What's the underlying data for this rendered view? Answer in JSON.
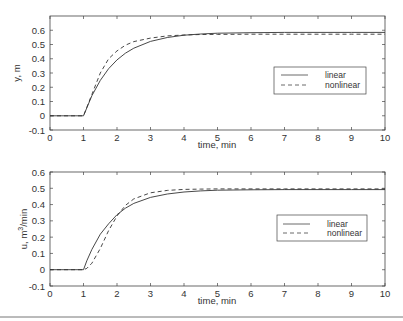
{
  "chart_data": [
    {
      "type": "line",
      "title": "",
      "xlabel": "time, min",
      "ylabel": "y, m",
      "xlim": [
        0,
        10
      ],
      "ylim": [
        -0.1,
        0.7
      ],
      "xticks": [
        0,
        1,
        2,
        3,
        4,
        5,
        6,
        7,
        8,
        9,
        10
      ],
      "yticks": [
        -0.1,
        0,
        0.1,
        0.2,
        0.3,
        0.4,
        0.5,
        0.6
      ],
      "ytick_labels": [
        "-0.1",
        "0",
        "0.1",
        "0.2",
        "0.3",
        "0.4",
        "0.5",
        "0.6"
      ],
      "grid": false,
      "legend_position": "center-right",
      "x": [
        0,
        1,
        1.25,
        1.5,
        1.75,
        2,
        2.25,
        2.5,
        3,
        3.5,
        4,
        4.5,
        5,
        6,
        7,
        8,
        9,
        10
      ],
      "series": [
        {
          "name": "linear",
          "style": "solid",
          "values": [
            0,
            0,
            0.141,
            0.248,
            0.33,
            0.392,
            0.439,
            0.474,
            0.522,
            0.549,
            0.565,
            0.574,
            0.579,
            0.583,
            0.585,
            0.585,
            0.585,
            0.585
          ]
        },
        {
          "name": "nonlinear",
          "style": "dashed",
          "values": [
            0,
            0,
            0.15,
            0.3,
            0.4,
            0.455,
            0.495,
            0.52,
            0.545,
            0.56,
            0.567,
            0.57,
            0.571,
            0.572,
            0.572,
            0.572,
            0.572,
            0.572
          ]
        }
      ]
    },
    {
      "type": "line",
      "title": "",
      "xlabel": "time, min",
      "ylabel": "u, m³/min",
      "xlim": [
        0,
        10
      ],
      "ylim": [
        -0.1,
        0.6
      ],
      "xticks": [
        0,
        1,
        2,
        3,
        4,
        5,
        6,
        7,
        8,
        9,
        10
      ],
      "yticks": [
        -0.1,
        0,
        0.1,
        0.2,
        0.3,
        0.4,
        0.5,
        0.6
      ],
      "ytick_labels": [
        "-0.1",
        "0",
        "0.1",
        "0.2",
        "0.3",
        "0.4",
        "0.5",
        "0.6"
      ],
      "grid": false,
      "legend_position": "center-right",
      "x": [
        0,
        1,
        1.1,
        1.25,
        1.5,
        1.75,
        2,
        2.25,
        2.5,
        3,
        3.5,
        4,
        4.5,
        5,
        6,
        7,
        8,
        9,
        10
      ],
      "series": [
        {
          "name": "linear",
          "style": "solid",
          "values": [
            0,
            0,
            0.055,
            0.125,
            0.218,
            0.282,
            0.338,
            0.378,
            0.407,
            0.444,
            0.465,
            0.477,
            0.484,
            0.488,
            0.491,
            0.492,
            0.492,
            0.492,
            0.492
          ]
        },
        {
          "name": "nonlinear",
          "style": "dashed",
          "values": [
            0,
            0,
            0.008,
            0.04,
            0.13,
            0.24,
            0.33,
            0.395,
            0.435,
            0.472,
            0.487,
            0.493,
            0.495,
            0.496,
            0.496,
            0.496,
            0.496,
            0.496,
            0.496
          ]
        }
      ]
    }
  ],
  "legend": {
    "linear": "linear",
    "nonlinear": "nonlinear"
  },
  "top_plot": {
    "xlabel": "time, min",
    "ylabel": "y, m"
  },
  "bottom_plot": {
    "xlabel": "time, min",
    "ylabel_main": "u, m",
    "ylabel_sup": "3",
    "ylabel_tail": "/min"
  }
}
